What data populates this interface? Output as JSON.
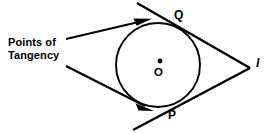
{
  "figure": {
    "type": "geometry-diagram",
    "background_color": "#ffffff",
    "stroke_color": "#000000",
    "caption": {
      "name": "points-of-tangency-caption",
      "line1": "Points of",
      "line2": "Tangency",
      "text": "Points of Tangency"
    },
    "labels": {
      "circle_center": "O",
      "upper_tangency_point": "Q",
      "lower_tangency_point": "P",
      "external_point": "l"
    },
    "circle": {
      "name": "circle-O",
      "center_x": 158,
      "center_y": 65,
      "radius": 42
    },
    "center_dot": {
      "x": 160,
      "y": 61,
      "radius": 2.4
    },
    "tangent_lines": [
      {
        "name": "upper-tangent-line",
        "x1": 137,
        "y1": 3,
        "x2": 250,
        "y2": 68,
        "touches": "Q"
      },
      {
        "name": "lower-tangent-line",
        "x1": 133,
        "y1": 130,
        "x2": 250,
        "y2": 68,
        "touches": "P"
      }
    ],
    "leader_arrows": [
      {
        "name": "upper-leader-arrow",
        "x1": 66,
        "y1": 39,
        "x2": 150,
        "y2": 19,
        "points_to": "upper-tangent-line"
      },
      {
        "name": "lower-leader-arrow",
        "x1": 66,
        "y1": 66,
        "x2": 152,
        "y2": 110,
        "points_to": "lower-tangent-line"
      }
    ],
    "apex": {
      "name": "external-point-l",
      "x": 247,
      "y": 66
    }
  }
}
